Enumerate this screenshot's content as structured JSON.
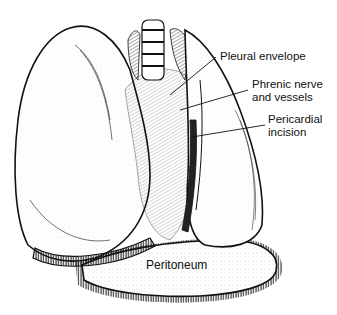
{
  "figure": {
    "type": "anatomical line illustration",
    "labels": {
      "pleural_envelope": "Pleural envelope",
      "phrenic": "Phrenic nerve\nand vessels",
      "pericardial": "Pericardial\nincision",
      "peritoneum": "Peritoneum"
    },
    "colors": {
      "ink": "#111111",
      "background": "#ffffff",
      "stipple": "#555555"
    }
  }
}
